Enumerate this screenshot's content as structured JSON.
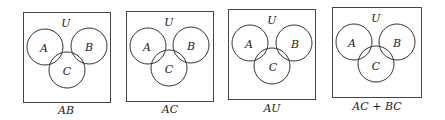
{
  "diagrams": [
    {
      "caption": "AB",
      "universe": "U",
      "sets": [
        "A",
        "B",
        "C"
      ]
    },
    {
      "caption": "AC",
      "universe": "U",
      "sets": [
        "A",
        "B",
        "C"
      ]
    },
    {
      "caption": "AU",
      "universe": "U",
      "sets": [
        "A",
        "B",
        "C"
      ]
    },
    {
      "caption": "AC + BC",
      "universe": "U",
      "sets": [
        "A",
        "B",
        "C"
      ]
    }
  ],
  "colors": {
    "stroke": "#333333",
    "background": "#ffffff"
  }
}
